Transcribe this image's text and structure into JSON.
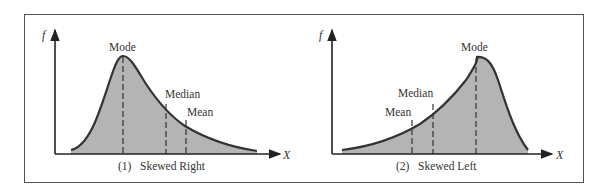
{
  "figure": {
    "panels": [
      {
        "id": "skewed-right",
        "caption": "(1)   Skewed Right",
        "y_axis_label": "f",
        "x_axis_label": "X",
        "markers": [
          {
            "label": "Mode"
          },
          {
            "label": "Median"
          },
          {
            "label": "Mean"
          }
        ]
      },
      {
        "id": "skewed-left",
        "caption": "(2)   Skewed Left",
        "y_axis_label": "f",
        "x_axis_label": "X",
        "markers": [
          {
            "label": "Mode"
          },
          {
            "label": "Median"
          },
          {
            "label": "Mean"
          }
        ]
      }
    ],
    "colors": {
      "fill": "#b4b4b4",
      "curve": "#333333",
      "axis": "#222222",
      "border": "#555555"
    }
  }
}
